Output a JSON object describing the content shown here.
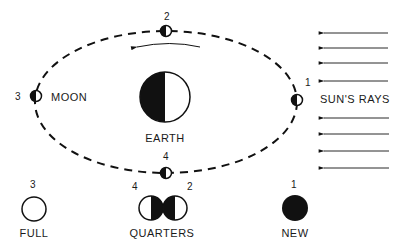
{
  "diagram": {
    "orbit": {
      "positions": [
        {
          "number": "1",
          "label": "",
          "lit_side": "right"
        },
        {
          "number": "2",
          "label": "",
          "lit_side": "right"
        },
        {
          "number": "3",
          "label": "MOON",
          "lit_side": "right"
        },
        {
          "number": "4",
          "label": "",
          "lit_side": "right"
        }
      ],
      "direction": "counter-clockwise"
    },
    "earth": {
      "label": "EARTH"
    },
    "sun": {
      "label": "SUN'S RAYS",
      "ray_count": 8
    },
    "phases": [
      {
        "numbers": [
          "3"
        ],
        "label": "FULL"
      },
      {
        "numbers": [
          "4",
          "2"
        ],
        "label": "QUARTERS"
      },
      {
        "numbers": [
          "1"
        ],
        "label": "NEW"
      }
    ],
    "colors": {
      "ink": "#111111",
      "background": "#ffffff"
    }
  }
}
